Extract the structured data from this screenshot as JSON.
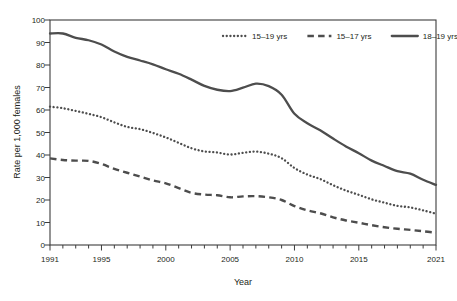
{
  "chart_data": {
    "type": "line",
    "title": "",
    "xlabel": "Year",
    "ylabel": "Rate per 1,000 females",
    "xlim": [
      1991,
      2021
    ],
    "ylim": [
      0,
      100
    ],
    "grid": false,
    "legend_position": "top-right",
    "x_tick_labels": [
      "1991",
      "1995",
      "2000",
      "2005",
      "2010",
      "2015",
      "2021"
    ],
    "x_tick_values": [
      1991,
      1995,
      2000,
      2005,
      2010,
      2015,
      2021
    ],
    "x_minor_ticks": [
      1991,
      1992,
      1993,
      1994,
      1995,
      1996,
      1997,
      1998,
      1999,
      2000,
      2001,
      2002,
      2003,
      2004,
      2005,
      2006,
      2007,
      2008,
      2009,
      2010,
      2011,
      2012,
      2013,
      2014,
      2015,
      2016,
      2017,
      2018,
      2019,
      2020,
      2021
    ],
    "y_tick_labels": [
      "0",
      "10",
      "20",
      "30",
      "40",
      "50",
      "60",
      "70",
      "80",
      "90",
      "100"
    ],
    "y_tick_values": [
      0,
      10,
      20,
      30,
      40,
      50,
      60,
      70,
      80,
      90,
      100
    ],
    "x": [
      1991,
      1992,
      1993,
      1994,
      1995,
      1996,
      1997,
      1998,
      1999,
      2000,
      2001,
      2002,
      2003,
      2004,
      2005,
      2006,
      2007,
      2008,
      2009,
      2010,
      2011,
      2012,
      2013,
      2014,
      2015,
      2016,
      2017,
      2018,
      2019,
      2020,
      2021
    ],
    "series": [
      {
        "name": "15–19 yrs",
        "style": "dotted",
        "color": "#4d4d4d",
        "values": [
          61.5,
          60.8,
          59.6,
          58.3,
          56.8,
          54.5,
          52.5,
          51.5,
          49.8,
          47.8,
          45.4,
          43.0,
          41.6,
          41.1,
          40.2,
          41.0,
          41.5,
          40.6,
          38.6,
          34.2,
          31.3,
          29.3,
          26.6,
          24.2,
          22.3,
          20.3,
          18.8,
          17.4,
          16.7,
          15.4,
          13.9
        ]
      },
      {
        "name": "15–17 yrs",
        "style": "dashed",
        "color": "#4d4d4d",
        "values": [
          38.5,
          37.8,
          37.5,
          37.4,
          36.0,
          33.8,
          32.1,
          30.4,
          28.7,
          27.4,
          25.3,
          23.2,
          22.4,
          22.1,
          21.2,
          21.6,
          21.7,
          21.2,
          20.0,
          17.3,
          15.4,
          14.1,
          12.3,
          10.9,
          9.9,
          8.8,
          7.9,
          7.2,
          6.7,
          6.1,
          5.5
        ]
      },
      {
        "name": "18–19 yrs",
        "style": "solid",
        "color": "#4d4d4d",
        "values": [
          94.0,
          94.0,
          92.1,
          91.0,
          89.1,
          86.0,
          83.6,
          82.0,
          80.3,
          78.1,
          76.1,
          73.5,
          70.7,
          69.0,
          68.4,
          69.9,
          71.7,
          70.6,
          66.8,
          58.3,
          54.1,
          51.0,
          47.3,
          43.8,
          40.8,
          37.5,
          35.1,
          32.8,
          31.7,
          29.0,
          26.7
        ]
      }
    ]
  },
  "legend": {
    "items": [
      {
        "label": "15–19 yrs",
        "style": "dotted"
      },
      {
        "label": "15–17 yrs",
        "style": "dashed"
      },
      {
        "label": "18–19 yrs",
        "style": "solid"
      }
    ]
  },
  "axes": {
    "x_title": "Year",
    "y_title": "Rate per 1,000 females"
  }
}
